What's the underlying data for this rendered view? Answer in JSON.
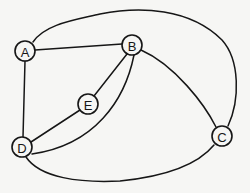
{
  "diagram": {
    "type": "undirected-graph",
    "nodes": [
      {
        "id": "A",
        "label": "A",
        "x": 25,
        "y": 51
      },
      {
        "id": "B",
        "label": "B",
        "x": 132,
        "y": 45
      },
      {
        "id": "C",
        "label": "C",
        "x": 222,
        "y": 136
      },
      {
        "id": "D",
        "label": "D",
        "x": 22,
        "y": 147
      },
      {
        "id": "E",
        "label": "E",
        "x": 88,
        "y": 104
      }
    ],
    "edges": [
      {
        "from": "A",
        "to": "B",
        "shape": "straight"
      },
      {
        "from": "A",
        "to": "D",
        "shape": "straight"
      },
      {
        "from": "A",
        "to": "C",
        "shape": "outer-top-arc"
      },
      {
        "from": "B",
        "to": "C",
        "shape": "curve"
      },
      {
        "from": "B",
        "to": "E",
        "shape": "straight"
      },
      {
        "from": "B",
        "to": "D",
        "shape": "curve"
      },
      {
        "from": "E",
        "to": "D",
        "shape": "straight"
      },
      {
        "from": "D",
        "to": "C",
        "shape": "outer-bottom-arc"
      }
    ],
    "colors": {
      "stroke": "#161616",
      "background": "#f6f6f4"
    }
  }
}
